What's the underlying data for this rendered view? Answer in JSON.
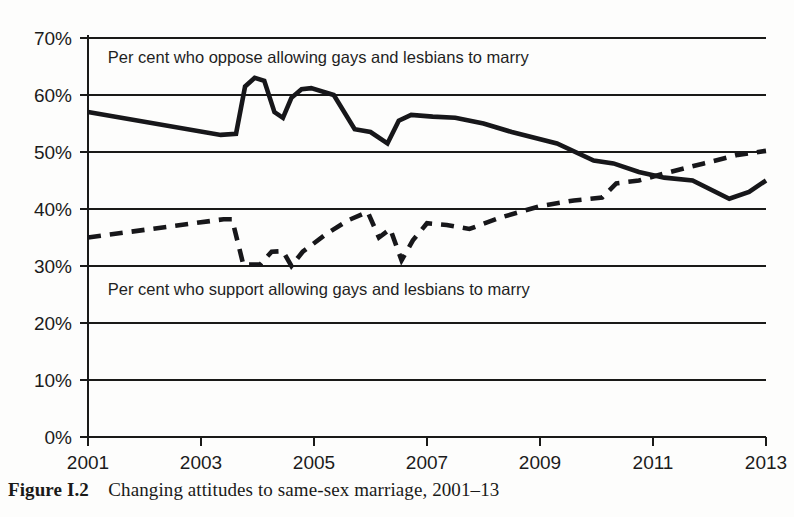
{
  "figure": {
    "caption_label": "Figure I.2",
    "caption_text": "Changing attitudes to same-sex marriage, 2001–13",
    "background_color": "#fdfdfc",
    "ink_color": "#1a1a18"
  },
  "chart_data": {
    "type": "line",
    "title": "",
    "subtitle": "",
    "xlabel": "",
    "ylabel": "",
    "xlim": [
      2001,
      2013
    ],
    "ylim": [
      0,
      70
    ],
    "grid": true,
    "grid_axis": "y",
    "legend_position": "inline-annotation",
    "x_ticks": [
      "2001",
      "2003",
      "2005",
      "2007",
      "2009",
      "2011",
      "2013"
    ],
    "x_tick_values": [
      2001,
      2003,
      2005,
      2007,
      2009,
      2011,
      2013
    ],
    "y_ticks": [
      "0%",
      "10%",
      "20%",
      "30%",
      "40%",
      "50%",
      "60%",
      "70%"
    ],
    "y_tick_values": [
      0,
      10,
      20,
      30,
      40,
      50,
      60,
      70
    ],
    "annotations": [
      {
        "id": "oppose-note",
        "text": "Per cent who oppose allowing gays and lesbians to marry",
        "x": 2001.35,
        "y": 66.5
      },
      {
        "id": "support-note",
        "text": "Per cent who support allowing gays and lesbians to marry",
        "x": 2001.35,
        "y": 25.8
      }
    ],
    "series": [
      {
        "name": "Per cent who oppose allowing gays and lesbians to marry",
        "style": "solid",
        "color": "#17171a",
        "width": 4.6,
        "x": [
          2001.0,
          2003.35,
          2003.62,
          2003.78,
          2003.95,
          2004.12,
          2004.3,
          2004.45,
          2004.6,
          2004.78,
          2004.95,
          2005.35,
          2005.72,
          2006.0,
          2006.3,
          2006.5,
          2006.72,
          2007.1,
          2007.5,
          2008.0,
          2008.5,
          2009.3,
          2009.95,
          2010.3,
          2010.75,
          2011.2,
          2011.7,
          2012.35,
          2012.7,
          2013.0
        ],
        "values": [
          57.0,
          53.0,
          53.2,
          61.5,
          63.0,
          62.5,
          57.0,
          56.0,
          59.5,
          61.0,
          61.2,
          60.0,
          54.0,
          53.5,
          51.5,
          55.5,
          56.5,
          56.2,
          56.0,
          55.0,
          53.5,
          51.5,
          48.5,
          48.0,
          46.5,
          45.5,
          45.0,
          41.8,
          43.0,
          45.0
        ]
      },
      {
        "name": "Per cent who support allowing gays and lesbians to marry",
        "style": "dashed",
        "color": "#17171a",
        "width": 4.6,
        "dash_pattern": "13 9",
        "x": [
          2001.0,
          2003.4,
          2003.55,
          2003.75,
          2004.05,
          2004.25,
          2004.45,
          2004.6,
          2004.8,
          2005.2,
          2005.6,
          2005.95,
          2006.15,
          2006.35,
          2006.55,
          2006.75,
          2007.0,
          2007.35,
          2007.75,
          2008.3,
          2009.0,
          2009.6,
          2010.1,
          2010.35,
          2010.75,
          2011.3,
          2011.9,
          2012.5,
          2013.0
        ],
        "values": [
          35.0,
          38.2,
          38.2,
          30.2,
          30.3,
          32.5,
          32.6,
          30.0,
          32.5,
          35.5,
          38.0,
          39.5,
          35.0,
          36.5,
          31.0,
          34.5,
          37.5,
          37.2,
          36.5,
          38.5,
          40.5,
          41.5,
          42.0,
          44.5,
          45.0,
          46.5,
          48.0,
          49.5,
          50.2
        ]
      }
    ]
  }
}
